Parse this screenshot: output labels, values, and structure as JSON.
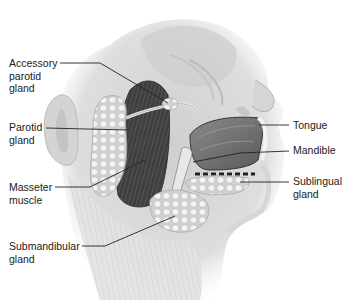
{
  "figure": {
    "labels": [
      {
        "id": "accessory-parotid",
        "text": "Accessory\nparotid\ngland",
        "x": 9,
        "y": 57,
        "line": [
          [
            60,
            63
          ],
          [
            100,
            63
          ],
          [
            168,
            103
          ]
        ]
      },
      {
        "id": "parotid",
        "text": "Parotid\ngland",
        "x": 9,
        "y": 121,
        "line": [
          [
            46,
            128
          ],
          [
            128,
            130
          ]
        ]
      },
      {
        "id": "masseter",
        "text": "Masseter\nmuscle",
        "x": 9,
        "y": 181,
        "line": [
          [
            55,
            187
          ],
          [
            90,
            187
          ],
          [
            145,
            160
          ]
        ]
      },
      {
        "id": "submandibular",
        "text": "Submandibular\ngland",
        "x": 9,
        "y": 240,
        "line": [
          [
            82,
            246
          ],
          [
            105,
            246
          ],
          [
            175,
            216
          ]
        ]
      },
      {
        "id": "tongue",
        "text": "Tongue",
        "x": 293,
        "y": 119,
        "line": [
          [
            259,
            125
          ],
          [
            289,
            125
          ]
        ]
      },
      {
        "id": "mandible",
        "text": "Mandible",
        "x": 293,
        "y": 144,
        "line": [
          [
            193,
            162
          ],
          [
            240,
            153
          ],
          [
            289,
            151
          ]
        ]
      },
      {
        "id": "sublingual",
        "text": "Sublingual\ngland",
        "x": 293,
        "y": 175,
        "line": [
          [
            240,
            182
          ],
          [
            289,
            182
          ]
        ]
      }
    ]
  },
  "colors": {
    "background": "#ffffff",
    "label_text": "#1a1a1a",
    "leader_line": "#222222",
    "skin": "#d9d9d9",
    "muscle_dark": "#4a4a4a",
    "gland": "#eeeeee"
  }
}
